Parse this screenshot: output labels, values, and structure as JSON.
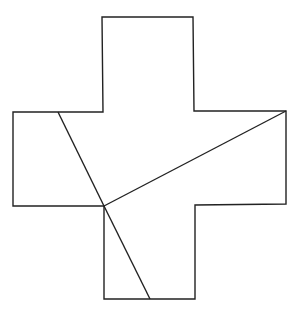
{
  "diagram": {
    "title": "",
    "stroke_color": "#222222",
    "background": "#ffffff",
    "stroke_width": 1.4,
    "cross_outline": [
      [
        102,
        17
      ],
      [
        193,
        17
      ],
      [
        194,
        111
      ],
      [
        286,
        111
      ],
      [
        286,
        204
      ],
      [
        195,
        205
      ],
      [
        195,
        299
      ],
      [
        104,
        299
      ],
      [
        104,
        206
      ],
      [
        13,
        206
      ],
      [
        13,
        112
      ],
      [
        103,
        112
      ]
    ],
    "cut_lines": [
      {
        "name": "cut-upper-left-to-center",
        "from": [
          58,
          112
        ],
        "to": [
          104,
          206
        ]
      },
      {
        "name": "cut-center-to-lower",
        "from": [
          104,
          206
        ],
        "to": [
          150,
          299
        ]
      },
      {
        "name": "cut-center-to-right-corner",
        "from": [
          104,
          206
        ],
        "to": [
          286,
          111
        ]
      }
    ]
  }
}
